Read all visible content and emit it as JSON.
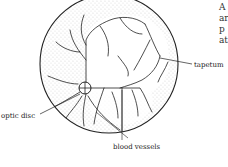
{
  "figure": {
    "type": "fundus diagram",
    "labels": {
      "tapetum": "tapetum",
      "optic_disc": "optic disc",
      "blood_vessels": "blood vessels"
    },
    "side_text_fragments": [
      "A",
      "ar",
      "p",
      "at"
    ]
  }
}
